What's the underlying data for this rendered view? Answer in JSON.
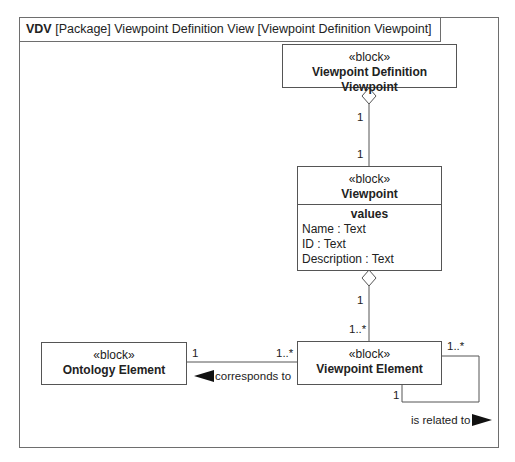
{
  "frame": {
    "kind": "VDV",
    "title": "[Package] Viewpoint Definition View [Viewpoint Definition Viewpoint]"
  },
  "blocks": [
    {
      "id": "vdv",
      "stereotype": "«block»",
      "name": "Viewpoint Definition Viewpoint"
    },
    {
      "id": "viewpoint",
      "stereotype": "«block»",
      "name": "Viewpoint",
      "compartment": {
        "title": "values",
        "properties": [
          "Name : Text",
          "ID : Text",
          "Description : Text"
        ]
      }
    },
    {
      "id": "viewpoint_element",
      "stereotype": "«block»",
      "name": "Viewpoint Element"
    },
    {
      "id": "ontology_element",
      "stereotype": "«block»",
      "name": "Ontology Element"
    }
  ],
  "relationships": [
    {
      "type": "aggregation",
      "from": "Viewpoint Definition Viewpoint",
      "to": "Viewpoint",
      "whole_multiplicity": "1",
      "part_multiplicity": "1"
    },
    {
      "type": "aggregation",
      "from": "Viewpoint",
      "to": "Viewpoint Element",
      "whole_multiplicity": "1",
      "part_multiplicity": "1..*"
    },
    {
      "type": "association",
      "from": "Viewpoint Element",
      "to": "Ontology Element",
      "label": "corresponds to",
      "source_multiplicity": "1..*",
      "target_multiplicity": "1"
    },
    {
      "type": "association",
      "from": "Viewpoint Element",
      "to": "Viewpoint Element",
      "label": "is related to",
      "source_multiplicity": "1..*",
      "target_multiplicity": "1"
    }
  ],
  "colors": {
    "line": "#555555",
    "text": "#222222",
    "background": "#ffffff"
  }
}
